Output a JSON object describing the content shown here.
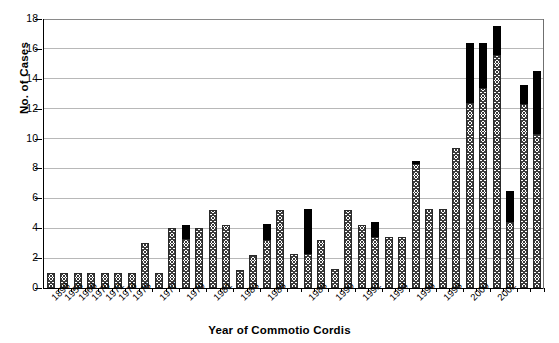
{
  "chart_data": {
    "type": "bar",
    "title": "",
    "xlabel": "Year of Commotio Cordis",
    "ylabel": "No. of Cases",
    "ylim": [
      0,
      18
    ],
    "ytick_step": 2,
    "ytick_labels": [
      "0",
      "2",
      "4",
      "6",
      "8",
      "10",
      "12",
      "14",
      "16",
      "18"
    ],
    "grid": true,
    "grid_axis": "y",
    "legend": "none",
    "stacked": true,
    "series": [
      {
        "name": "hatched-segment",
        "fill": "hatched",
        "color": "#3a3a3a",
        "values": [
          1,
          1,
          1,
          1,
          1,
          1,
          1,
          3,
          1,
          4,
          3.3,
          4,
          5.2,
          4.2,
          1.2,
          2.2,
          3.2,
          5.2,
          2.3,
          2.3,
          3.2,
          1.3,
          5.2,
          4.2,
          3.4,
          3.4,
          3.4,
          8.3,
          5.3,
          5.3,
          9.4,
          12.4,
          13.4,
          15.6,
          4.4,
          12.3,
          10.3
        ]
      },
      {
        "name": "solid-black-segment",
        "fill": "solid",
        "color": "#000000",
        "values": [
          0,
          0,
          0,
          0,
          0,
          0,
          0,
          0,
          0,
          0,
          0.9,
          0,
          0,
          0,
          0,
          0,
          1.1,
          0,
          0,
          3,
          0,
          0,
          0,
          0,
          1,
          0,
          0,
          0.2,
          0,
          0,
          0,
          4,
          3,
          1.9,
          2.1,
          1.3,
          4.2
        ]
      }
    ],
    "categories": [
      "1898",
      "1958",
      "1966",
      "1970",
      "1971",
      "1974",
      "1975",
      "1976",
      "1977",
      "1978",
      "1979",
      "1980",
      "1981",
      "1982",
      "1983",
      "1984",
      "1985",
      "1986",
      "1987",
      "1988",
      "1989",
      "1990",
      "1991",
      "1992",
      "1993",
      "1994",
      "1995",
      "1996",
      "1997",
      "1998",
      "1999",
      "2000",
      "2001",
      "2002",
      "2003",
      "2004",
      "2005"
    ],
    "totals": [
      1,
      1,
      1,
      1,
      1,
      1,
      1,
      3,
      1,
      4,
      4.2,
      4,
      5.2,
      4.2,
      1.2,
      2.2,
      4.3,
      5.2,
      2.3,
      5.3,
      3.2,
      1.3,
      5.2,
      4.2,
      4.4,
      3.4,
      3.4,
      8.5,
      5.3,
      5.3,
      9.4,
      16.4,
      16.4,
      17.5,
      6.5,
      13.6,
      14.5
    ],
    "visible_tick_labels": [
      {
        "index": 0,
        "label": "1898"
      },
      {
        "index": 1,
        "label": "1958"
      },
      {
        "index": 2,
        "label": "1966"
      },
      {
        "index": 3,
        "label": "1970"
      },
      {
        "index": 4,
        "label": "1971"
      },
      {
        "index": 5,
        "label": "1974"
      },
      {
        "index": 6,
        "label": "1975"
      },
      {
        "index": 8,
        "label": "1977"
      },
      {
        "index": 10,
        "label": "1979"
      },
      {
        "index": 12,
        "label": "1981"
      },
      {
        "index": 14,
        "label": "1983"
      },
      {
        "index": 16,
        "label": "1985"
      },
      {
        "index": 19,
        "label": "1988"
      },
      {
        "index": 21,
        "label": "1990"
      },
      {
        "index": 23,
        "label": "1992"
      },
      {
        "index": 25,
        "label": "1994"
      },
      {
        "index": 27,
        "label": "1996"
      },
      {
        "index": 29,
        "label": "1998"
      },
      {
        "index": 31,
        "label": "2000"
      },
      {
        "index": 33,
        "label": "2002"
      }
    ]
  },
  "colors": {
    "axis": "#000000",
    "gridline": "#b8b8b8",
    "bar_solid": "#000000",
    "bar_hatch": "#3a3a3a",
    "background": "#ffffff"
  }
}
